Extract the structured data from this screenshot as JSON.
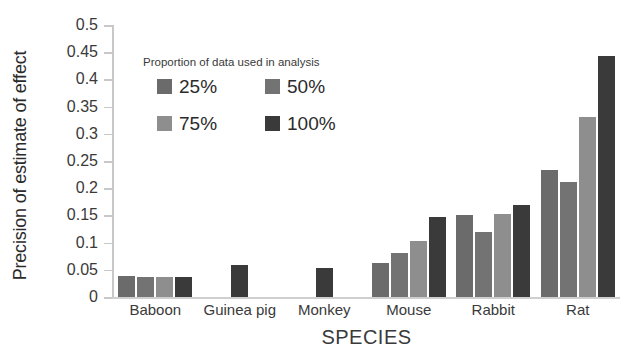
{
  "chart_data": {
    "type": "bar",
    "title": "",
    "xlabel": "SPECIES",
    "ylabel": "Precision of estimate of effect",
    "categories": [
      "Baboon",
      "Guinea pig",
      "Monkey",
      "Mouse",
      "Rabbit",
      "Rat"
    ],
    "series": [
      {
        "name": "25%",
        "color": "#6b6b6b",
        "values": [
          0.039,
          null,
          null,
          0.062,
          0.15,
          0.233
        ]
      },
      {
        "name": "50%",
        "color": "#737373",
        "values": [
          0.037,
          null,
          null,
          0.08,
          0.12,
          0.212
        ]
      },
      {
        "name": "75%",
        "color": "#8e8e8e",
        "values": [
          0.036,
          null,
          null,
          0.103,
          0.153,
          0.331
        ]
      },
      {
        "name": "100%",
        "color": "#3a3a3a",
        "values": [
          0.037,
          0.058,
          0.053,
          0.148,
          0.169,
          0.443
        ]
      }
    ],
    "ylim": [
      0,
      0.5
    ],
    "yticks": [
      0,
      0.05,
      0.1,
      0.15,
      0.2,
      0.25,
      0.3,
      0.35,
      0.4,
      0.45,
      0.5
    ],
    "ytick_labels": [
      "0",
      "0.05",
      "0.1",
      "0.15",
      "0.2",
      "0.25",
      "0.3",
      "0.35",
      "0.4",
      "0.45",
      "0.5"
    ],
    "grid": false,
    "legend_position": "inside-top-left"
  },
  "legend": {
    "title": "Proportion of data used in analysis",
    "items": [
      {
        "label": "25%",
        "color": "#6b6b6b"
      },
      {
        "label": "50%",
        "color": "#737373"
      },
      {
        "label": "75%",
        "color": "#8e8e8e"
      },
      {
        "label": "100%",
        "color": "#3a3a3a"
      }
    ]
  },
  "axes": {
    "y_title": "Precision of estimate of effect",
    "x_title": "SPECIES",
    "axis_color": "#c8c8c8"
  }
}
